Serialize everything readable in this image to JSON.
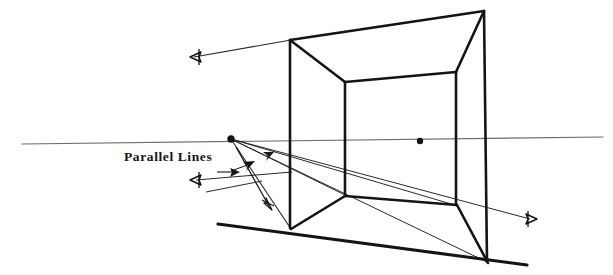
{
  "figure": {
    "background_color": "#ffffff",
    "ink_color": "#141414",
    "light_ink_color": "#6b6b6b",
    "width": 613,
    "height": 275,
    "labels": [
      {
        "id": "parallel-lines",
        "text": "Parallel Lines",
        "x": 124,
        "y": 150
      }
    ],
    "horizon": {
      "name": "horizon-line",
      "x1": 22,
      "y1": 144,
      "x2": 603,
      "y2": 137,
      "stroke": "#6b6b6b",
      "stroke_width": 1.1
    },
    "vanishing_points": [
      {
        "id": "left-vanishing-point",
        "x": 231,
        "y": 139,
        "r": 3.6
      },
      {
        "id": "right-vanishing-point",
        "x": 420,
        "y": 141,
        "r": 3.1
      }
    ],
    "box": {
      "name": "perspective-box",
      "stroke": "#141414",
      "stroke_width": 2.6,
      "vertices": {
        "front_left_top": {
          "x": 290,
          "y": 40
        },
        "front_left_bottom": {
          "x": 290,
          "y": 228
        },
        "front_right_top": {
          "x": 484,
          "y": 11
        },
        "front_right_bottom": {
          "x": 487,
          "y": 262
        },
        "back_left_top": {
          "x": 345,
          "y": 82
        },
        "back_left_bottom": {
          "x": 345,
          "y": 195
        },
        "back_right_top": {
          "x": 456,
          "y": 72
        },
        "back_right_bottom": {
          "x": 456,
          "y": 205
        }
      },
      "edges": [
        "front_left_top-front_right_top",
        "front_left_top-front_left_bottom",
        "front_right_top-front_right_bottom",
        "front_left_bottom-front_right_bottom",
        "front_left_top-back_left_top",
        "front_right_top-back_right_top",
        "back_left_top-back_right_top",
        "back_left_top-back_left_bottom",
        "back_right_top-back_right_bottom",
        "back_left_bottom-back_right_bottom",
        "front_left_bottom-back_left_bottom",
        "front_right_bottom-back_right_bottom"
      ]
    },
    "ground_line": {
      "name": "ground-line",
      "x1": 218,
      "y1": 225,
      "x2": 527,
      "y2": 265,
      "stroke": "#141414",
      "stroke_width": 3.0
    },
    "convergence_rays": [
      {
        "id": "ray-left-vp-to-back-left-bottom",
        "x1": 231,
        "y1": 139,
        "x2": 345,
        "y2": 195
      },
      {
        "id": "ray-left-vp-to-front-left-bottom",
        "x1": 231,
        "y1": 139,
        "x2": 290,
        "y2": 228
      },
      {
        "id": "ray-left-vp-to-back-right-bottom",
        "x1": 231,
        "y1": 139,
        "x2": 456,
        "y2": 205
      },
      {
        "id": "ray-left-vp-to-front-right-bottom",
        "x1": 231,
        "y1": 139,
        "x2": 487,
        "y2": 262
      },
      {
        "id": "ray-left-vp-through-to-right-arrow",
        "x1": 231,
        "y1": 139,
        "x2": 528,
        "y2": 219
      }
    ],
    "arrows": [
      {
        "id": "arrow-upper-left",
        "style": "open",
        "tip": {
          "x": 190,
          "y": 57
        },
        "tail": {
          "x": 290,
          "y": 40
        },
        "direction": "left"
      },
      {
        "id": "arrow-mid-left",
        "style": "open",
        "tip": {
          "x": 190,
          "y": 180
        },
        "tail": {
          "x": 276,
          "y": 174
        },
        "direction": "left"
      },
      {
        "id": "arrow-lower-right-exit",
        "style": "open",
        "tip": {
          "x": 535,
          "y": 219
        },
        "tail": {
          "x": 430,
          "y": 196
        },
        "direction": "right"
      },
      {
        "id": "arrow-small-right-inner",
        "style": "solid",
        "tip": {
          "x": 238,
          "y": 173
        },
        "tail": {
          "x": 222,
          "y": 172
        },
        "direction": "right"
      },
      {
        "id": "arrow-solid-upper-inner",
        "style": "solid",
        "tip": {
          "x": 252,
          "y": 163
        },
        "tail": {
          "x": 232,
          "y": 170
        },
        "direction": "up-right"
      },
      {
        "id": "arrow-solid-top-inner",
        "style": "solid",
        "tip": {
          "x": 271,
          "y": 153
        },
        "tail": {
          "x": 256,
          "y": 160
        },
        "direction": "up-right"
      },
      {
        "id": "arrow-down-right-open",
        "style": "open",
        "tip": {
          "x": 271,
          "y": 208
        },
        "tail": {
          "x": 238,
          "y": 150
        },
        "direction": "down-right"
      }
    ],
    "guide_lines": [
      {
        "id": "guide-short-lower-left",
        "x1": 207,
        "y1": 192,
        "x2": 258,
        "y2": 182
      },
      {
        "id": "guide-to-right-arrow",
        "x1": 199,
        "y1": 180,
        "x2": 528,
        "y2": 219
      }
    ]
  }
}
